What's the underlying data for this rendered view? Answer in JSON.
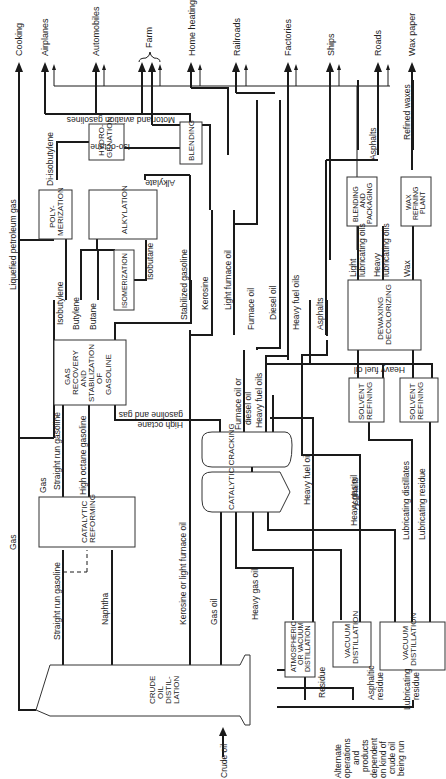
{
  "products": [
    {
      "id": "cooking",
      "label": "Cooking"
    },
    {
      "id": "airplanes",
      "label": "Airplanes"
    },
    {
      "id": "automobiles",
      "label": "Automobiles"
    },
    {
      "id": "farm",
      "label": "Farm"
    },
    {
      "id": "home_heating",
      "label": "Home heating"
    },
    {
      "id": "railroads",
      "label": "Railroads"
    },
    {
      "id": "factories",
      "label": "Factories"
    },
    {
      "id": "ships",
      "label": "Ships"
    },
    {
      "id": "roads",
      "label": "Roads"
    },
    {
      "id": "wax_paper",
      "label": "Wax paper"
    }
  ],
  "units": {
    "crude": [
      "CRUDE",
      "OIL",
      "DISTIL-",
      "LATION"
    ],
    "catalytic_reforming": [
      "CATALYTIC",
      "REFORMING"
    ],
    "gas_recovery": [
      "GAS",
      "RECOVERY",
      "AND",
      "STABILIZATION",
      "OF",
      "GASOLINE"
    ],
    "polymerization": [
      "POLY-",
      "MERIZATION"
    ],
    "alkylation": [
      "ALKYLATION"
    ],
    "isomerization": [
      "ISOMERIZATION"
    ],
    "hydrogenation": [
      "HYDRO-",
      "GENATION"
    ],
    "blending": [
      "BLENDING"
    ],
    "catalytic_cracking": "CATALYTIC   CRACKING",
    "atm_vac_distillation": [
      "ATMOSPHERIC",
      "OR VACUUM",
      "DISTILLATION"
    ],
    "vacuum_distillation_1": [
      "VACUUM",
      "DISTILLATION"
    ],
    "vacuum_distillation_2": [
      "VACUUM",
      "DISTILLATION"
    ],
    "solvent_refining_1": [
      "SOLVENT",
      "REFINING"
    ],
    "solvent_refining_2": [
      "SOLVENT",
      "REFINING"
    ],
    "dewaxing": [
      "DEWAXING",
      "DECOLORIZING"
    ],
    "blending_packaging": [
      "BLENDING",
      "AND",
      "PACKAGING"
    ],
    "wax_refining": [
      "WAX",
      "REFINING",
      "PLANT"
    ]
  },
  "streams": {
    "lpg": "Liquefied petroleum gas",
    "gas": "Gas",
    "gas2": "Gas",
    "straight_run_gasoline_top": "Straight run gasoline",
    "straight_run_gasoline": "Straight run gasoline",
    "naphtha": "Naphtha",
    "high_octane_gasoline": "High octane gasoline",
    "kerosine_light_furnace": "Kerosine or light furnace oil",
    "gas_oil": "Gas oil",
    "isobutylene": "Isobutylene",
    "butylene": "Butylene",
    "butane": "Butane",
    "isobutane": "Isobutane",
    "di_isobutylene": "Di-isobutylene",
    "iso_octane": "Iso-octane",
    "alkylate": "Alkylate",
    "motor_aviation": "Motor and aviation gasolines",
    "stabilized_gasoline": "Stabilized gasoline",
    "high_octane_gas": [
      "High octane",
      "gasoline and gas"
    ],
    "kerosine": "Kerosine",
    "light_furnace_oil": "Light furnace oil",
    "furnace_oil": "Furnace oil",
    "diesel_oil": "Diesel oil",
    "heavy_fuel_oils": "Heavy fuel oils",
    "asphalts": "Asphalts",
    "asphalts_top": "Asphalts",
    "furnace_or_diesel": [
      "Furnace oil or",
      "diesel oil"
    ],
    "heavy_fuel_oils_2": "Heavy fuel oils",
    "heavy_fuel_oil": "Heavy fuel oil",
    "heavy_fuel_oil_h": "Heavy fuel oil",
    "heavy_gas_oil": "Heavy gas oil",
    "heavy_gas_oil_2": "Heavy gas oil",
    "asphalts_mid": "Asphalts",
    "lubricating_distillates": "Lubricating distillates",
    "lubricating_residue": "Lubricating residue",
    "light_lub": [
      "Light",
      "lubricating oils"
    ],
    "heavy_lub": [
      "Heavy",
      "lubricating oils"
    ],
    "wax": "Wax",
    "refined_waxes": "Refined waxes",
    "residue": "Residue",
    "asphaltic_residue": [
      "Asphaltic",
      "residue"
    ],
    "lubricating_residue_bottom": [
      "Lubricating",
      "residue"
    ],
    "crude_oil": "Crude oil"
  },
  "note": [
    "Alternate",
    "operations",
    "and",
    "products",
    "dependent",
    "on kind of",
    "crude oil",
    "being run"
  ]
}
